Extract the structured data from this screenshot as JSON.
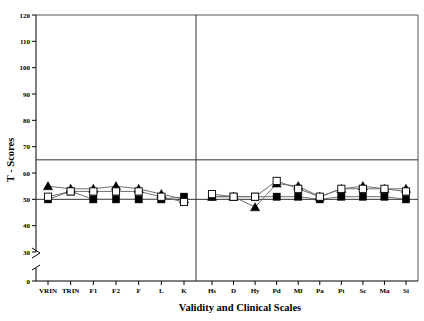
{
  "chart_data": {
    "type": "line",
    "title": "",
    "xlabel": "Validity and Clinical Scales",
    "ylabel": "T - Scores",
    "categories": [
      "VRIN",
      "TRIN",
      "F1",
      "F2",
      "F",
      "L",
      "K",
      "Hs",
      "D",
      "Hy",
      "Pd",
      "Mf",
      "Pa",
      "Pt",
      "Sc",
      "Ma",
      "Si"
    ],
    "validity_scales": [
      "VRIN",
      "TRIN",
      "F1",
      "F2",
      "F",
      "L",
      "K"
    ],
    "clinical_scales": [
      "Hs",
      "D",
      "Hy",
      "Pd",
      "Mf",
      "Pa",
      "Pt",
      "Sc",
      "Ma",
      "Si"
    ],
    "ylim": [
      0,
      120
    ],
    "yticks": [
      0,
      30,
      40,
      50,
      60,
      70,
      80,
      90,
      100,
      110,
      120
    ],
    "ytick_labels": [
      "0",
      "30",
      "40",
      "50",
      "60",
      "70",
      "80",
      "90",
      "100",
      "110",
      "120"
    ],
    "axis_break": true,
    "axis_break_between": [
      0,
      30
    ],
    "grid": false,
    "legend": "none",
    "reference_lines": [
      65,
      50
    ],
    "group_divider_after": "K",
    "series": [
      {
        "name": "Group 1",
        "marker": "filled-triangle",
        "values": [
          55,
          54,
          54,
          55,
          54,
          52,
          50,
          51,
          51,
          47,
          56,
          55,
          51,
          54,
          55,
          54,
          54
        ]
      },
      {
        "name": "Group 2",
        "marker": "filled-square",
        "values": [
          50,
          53,
          50,
          50,
          50,
          50,
          51,
          51,
          51,
          51,
          51,
          51,
          50,
          51,
          51,
          51,
          50
        ]
      },
      {
        "name": "Group 3",
        "marker": "open-square",
        "values": [
          51,
          53,
          53,
          53,
          53,
          51,
          49,
          52,
          51,
          51,
          57,
          54,
          51,
          54,
          54,
          54,
          53
        ]
      }
    ]
  },
  "axes": {
    "y_title": "T - Scores",
    "x_title": "Validity and Clinical Scales"
  }
}
